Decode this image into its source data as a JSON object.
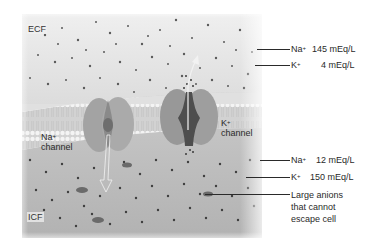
{
  "figure": {
    "regions": {
      "ecf": "ECF",
      "icf": "ICF"
    },
    "channels": [
      {
        "ion": "Na",
        "charge": "+",
        "word": "channel"
      },
      {
        "ion": "K",
        "charge": "+",
        "word": "channel"
      }
    ],
    "ecf_concentrations": [
      {
        "ion": "Na",
        "charge": "+",
        "value": "145 mEq/L"
      },
      {
        "ion": "K",
        "charge": "+",
        "value": "4 mEq/L"
      }
    ],
    "icf_concentrations": [
      {
        "ion": "Na",
        "charge": "+",
        "value": "12 mEq/L"
      },
      {
        "ion": "K",
        "charge": "+",
        "value": "150 mEq/L"
      }
    ],
    "anions_label": [
      "Large anions",
      "that cannot",
      "escape cell"
    ],
    "colors": {
      "ecf_bg": "#e4e4e4",
      "icf_bg": "#b9b9b9",
      "membrane": "#cfcfcf",
      "channel": "#9a9a9a",
      "channel_pore": "#5a5a5a",
      "dots": "#4a4a4a",
      "text": "#2a2a2a"
    }
  }
}
